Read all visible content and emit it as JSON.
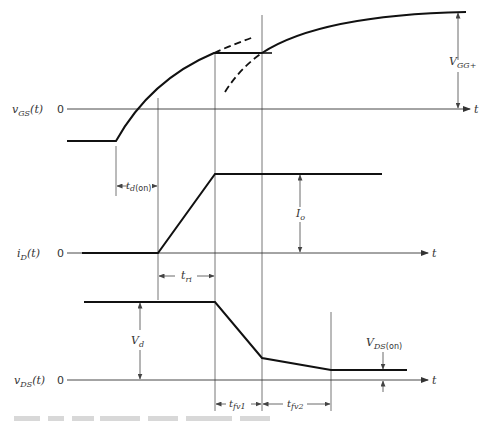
{
  "figure": {
    "type": "timing-diagram",
    "colors": {
      "waveform": "#111111",
      "axis": "#333333",
      "guide": "#666666",
      "background": "#ffffff"
    },
    "panels": [
      {
        "id": "vgs",
        "y_label": {
          "main": "v",
          "sub": "GS",
          "arg": "(t)"
        },
        "zero_label": "0",
        "x_label": "t",
        "annotation": {
          "main": "V",
          "sub": "GG+"
        }
      },
      {
        "id": "id",
        "y_label": {
          "main": "i",
          "sub": "D",
          "arg": "(t)"
        },
        "zero_label": "0",
        "x_label": "t",
        "annotation": {
          "main": "I",
          "sub": "o"
        }
      },
      {
        "id": "vds",
        "y_label": {
          "main": "v",
          "sub": "DS",
          "arg": "(t)"
        },
        "zero_label": "0",
        "x_label": "t",
        "annotation_vd": {
          "main": "V",
          "sub": "d"
        },
        "annotation_vdson": {
          "main": "V",
          "sub": "DS",
          "sub2": "(on)"
        }
      }
    ],
    "intervals": [
      {
        "main": "t",
        "sub": "d",
        "sub2": "(on)"
      },
      {
        "main": "t",
        "sub": "ri"
      },
      {
        "main": "t",
        "sub": "fv1"
      },
      {
        "main": "t",
        "sub": "fv2"
      }
    ]
  }
}
